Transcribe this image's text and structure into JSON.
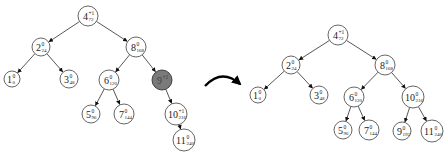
{
  "diagram": {
    "type": "avl-tree-rotation",
    "colors": {
      "highlight": "#7a7a7a",
      "stroke": "#555555",
      "background": "#ffffff"
    },
    "before": {
      "nodes": [
        {
          "id": "L4",
          "key": "4",
          "bf": "+1",
          "val": "72",
          "x": 88,
          "y": 16,
          "r": 10
        },
        {
          "id": "L2",
          "key": "2",
          "bf": "0",
          "val": "24",
          "x": 41,
          "y": 47,
          "r": 9
        },
        {
          "id": "L8",
          "key": "8",
          "bf": "0",
          "val": "168",
          "x": 136,
          "y": 47,
          "r": 10
        },
        {
          "id": "L1",
          "key": "1",
          "bf": "0",
          "val": "0",
          "x": 12,
          "y": 79,
          "r": 8
        },
        {
          "id": "L3",
          "key": "3",
          "bf": "0",
          "val": "48",
          "x": 69,
          "y": 79,
          "r": 9
        },
        {
          "id": "L6",
          "key": "6",
          "bf": "0",
          "val": "120",
          "x": 109,
          "y": 80,
          "r": 10
        },
        {
          "id": "L9",
          "key": "9",
          "bf": "+2",
          "val": "",
          "x": 162,
          "y": 80,
          "r": 10,
          "highlight": true
        },
        {
          "id": "L5",
          "key": "5",
          "bf": "0",
          "val": "96",
          "x": 91,
          "y": 114,
          "r": 9
        },
        {
          "id": "L7",
          "key": "7",
          "bf": "0",
          "val": "144",
          "x": 124,
          "y": 114,
          "r": 10
        },
        {
          "id": "L10",
          "key": "10",
          "bf": "+1",
          "val": "216",
          "x": 176,
          "y": 114,
          "r": 11
        },
        {
          "id": "L11",
          "key": "11",
          "bf": "0",
          "val": "240",
          "x": 184,
          "y": 140,
          "r": 11
        }
      ],
      "edges": [
        [
          "L4",
          "L2"
        ],
        [
          "L4",
          "L8"
        ],
        [
          "L2",
          "L1"
        ],
        [
          "L2",
          "L3"
        ],
        [
          "L8",
          "L6"
        ],
        [
          "L8",
          "L9"
        ],
        [
          "L6",
          "L5"
        ],
        [
          "L6",
          "L7"
        ],
        [
          "L9",
          "L10"
        ],
        [
          "L10",
          "L11"
        ]
      ]
    },
    "after": {
      "nodes": [
        {
          "id": "R4",
          "key": "4",
          "bf": "+1",
          "val": "72",
          "x": 338,
          "y": 35,
          "r": 10
        },
        {
          "id": "R2",
          "key": "2",
          "bf": "0",
          "val": "24",
          "x": 291,
          "y": 65,
          "r": 9
        },
        {
          "id": "R8",
          "key": "8",
          "bf": "0",
          "val": "168",
          "x": 385,
          "y": 65,
          "r": 10
        },
        {
          "id": "R1",
          "key": "1",
          "bf": "0",
          "val": "0",
          "x": 258,
          "y": 95,
          "r": 8
        },
        {
          "id": "R3",
          "key": "3",
          "bf": "0",
          "val": "48",
          "x": 319,
          "y": 95,
          "r": 9
        },
        {
          "id": "R6",
          "key": "6",
          "bf": "0",
          "val": "120",
          "x": 354,
          "y": 97,
          "r": 10
        },
        {
          "id": "R10",
          "key": "10",
          "bf": "0",
          "val": "216",
          "x": 413,
          "y": 97,
          "r": 11
        },
        {
          "id": "R5",
          "key": "5",
          "bf": "0",
          "val": "96",
          "x": 343,
          "y": 130,
          "r": 9
        },
        {
          "id": "R7",
          "key": "7",
          "bf": "0",
          "val": "144",
          "x": 369,
          "y": 130,
          "r": 10
        },
        {
          "id": "R9",
          "key": "9",
          "bf": "0",
          "val": "192",
          "x": 402,
          "y": 131,
          "r": 9
        },
        {
          "id": "R11",
          "key": "11",
          "bf": "0",
          "val": "240",
          "x": 432,
          "y": 131,
          "r": 11
        }
      ],
      "edges": [
        [
          "R4",
          "R2"
        ],
        [
          "R4",
          "R8"
        ],
        [
          "R2",
          "R1"
        ],
        [
          "R2",
          "R3"
        ],
        [
          "R8",
          "R6"
        ],
        [
          "R8",
          "R10"
        ],
        [
          "R6",
          "R5"
        ],
        [
          "R6",
          "R7"
        ],
        [
          "R10",
          "R9"
        ],
        [
          "R10",
          "R11"
        ]
      ]
    },
    "transition_arrow": {
      "label": "",
      "from": [
        205,
        82
      ],
      "to": [
        240,
        82
      ]
    }
  }
}
